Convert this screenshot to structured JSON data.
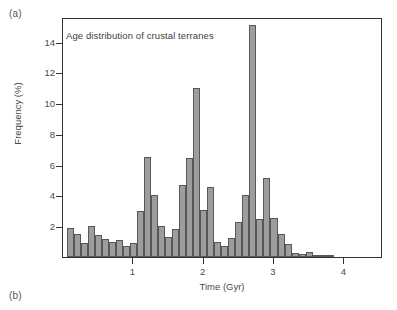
{
  "figure": {
    "panel_a_label": "(a)",
    "panel_b_label": "(b)"
  },
  "chart_data": {
    "type": "bar",
    "title": "Age distribution of crustal terranes",
    "xlabel": "Time (Gyr)",
    "ylabel": "Frequency (%)",
    "xlim": [
      0,
      4.55
    ],
    "ylim": [
      0,
      15.6
    ],
    "xticks": [
      1,
      2,
      3,
      4
    ],
    "yticks": [
      2,
      4,
      6,
      8,
      10,
      12,
      14
    ],
    "xtick_labels": [
      "1",
      "2",
      "3",
      "4"
    ],
    "ytick_labels": [
      "2",
      "4",
      "6",
      "8",
      "10",
      "12",
      "14"
    ],
    "grid": false,
    "legend": "none",
    "bin_width": 0.1,
    "bar_color": "#9d9d9d",
    "bar_edge_color": "#575757",
    "axis_color": "#333333",
    "bin_starts": [
      0.05,
      0.15,
      0.25,
      0.35,
      0.45,
      0.55,
      0.65,
      0.75,
      0.85,
      0.95,
      1.05,
      1.15,
      1.25,
      1.35,
      1.45,
      1.55,
      1.65,
      1.75,
      1.85,
      1.95,
      2.05,
      2.15,
      2.25,
      2.35,
      2.45,
      2.55,
      2.65,
      2.75,
      2.85,
      2.95,
      3.05,
      3.15,
      3.25,
      3.35,
      3.45,
      3.55,
      3.65,
      3.75,
      3.85,
      3.95
    ],
    "x": [
      0.1,
      0.2,
      0.3,
      0.4,
      0.5,
      0.6,
      0.7,
      0.8,
      0.9,
      1.0,
      1.1,
      1.2,
      1.3,
      1.4,
      1.5,
      1.6,
      1.7,
      1.8,
      1.9,
      2.0,
      2.1,
      2.2,
      2.3,
      2.4,
      2.5,
      2.6,
      2.7,
      2.8,
      2.9,
      3.0,
      3.1,
      3.2,
      3.3,
      3.4,
      3.5,
      3.6,
      3.7,
      3.8,
      3.9,
      4.0
    ],
    "values": [
      1.9,
      1.5,
      0.9,
      2.0,
      1.45,
      1.2,
      0.95,
      1.1,
      0.7,
      0.9,
      3.0,
      6.5,
      4.0,
      2.0,
      1.3,
      1.8,
      4.65,
      6.45,
      11.0,
      3.05,
      4.55,
      1.0,
      0.7,
      1.25,
      2.25,
      4.05,
      15.05,
      2.5,
      5.15,
      2.55,
      1.5,
      0.85,
      0.25,
      0.2,
      0.35,
      0.1,
      0.15,
      0.15,
      0.0,
      0.0
    ]
  }
}
